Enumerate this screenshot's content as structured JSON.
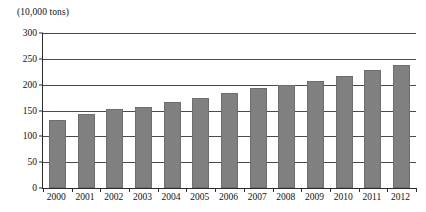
{
  "chart_data": {
    "type": "bar",
    "title": "",
    "subtitle": "",
    "unit_caption": "(10,000 tons)",
    "xlabel": "",
    "ylabel": "",
    "ylim": [
      0,
      300
    ],
    "ytick_step": 50,
    "yticks": [
      "0",
      "50",
      "100",
      "150",
      "200",
      "250",
      "300"
    ],
    "ytick_values": [
      0,
      50,
      100,
      150,
      200,
      250,
      300
    ],
    "grid": true,
    "grid_axis": "y",
    "legend": false,
    "legend_position": "none",
    "bar_color": "#808080",
    "axis_color": "#2b2b2b",
    "gridline_color": "#4a4a4a",
    "categories": [
      "2000",
      "2001",
      "2002",
      "2003",
      "2004",
      "2005",
      "2006",
      "2007",
      "2008",
      "2009",
      "2010",
      "2011",
      "2012"
    ],
    "values": [
      132,
      143,
      152,
      157,
      167,
      175,
      183,
      193,
      200,
      207,
      217,
      228,
      238
    ]
  }
}
